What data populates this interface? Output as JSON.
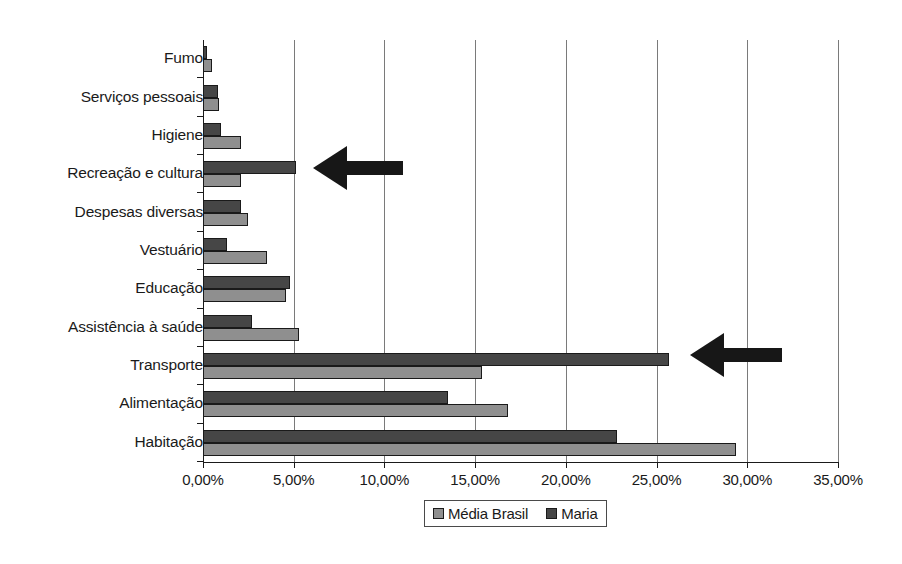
{
  "chart_data": {
    "type": "bar",
    "orientation": "horizontal",
    "title": "",
    "xlabel": "",
    "ylabel": "",
    "xlim": [
      0,
      35
    ],
    "xtick_labels": [
      "0,00%",
      "5,00%",
      "10,00%",
      "15,00%",
      "20,00%",
      "25,00%",
      "30,00%",
      "35,00%"
    ],
    "xticks": [
      0,
      5,
      10,
      15,
      20,
      25,
      30,
      35
    ],
    "grid": true,
    "grid_axis": "x",
    "legend_position": "bottom",
    "categories": [
      "Fumo",
      "Serviços pessoais",
      "Higiene",
      "Recreação e cultura",
      "Despesas diversas",
      "Vestuário",
      "Educação",
      "Assistência à saúde",
      "Transporte",
      "Alimentação",
      "Habitação"
    ],
    "series": [
      {
        "name": "Média Brasil",
        "color": "#8f8f8f",
        "values": [
          0.5,
          0.9,
          2.1,
          2.1,
          2.5,
          3.5,
          4.6,
          5.3,
          15.4,
          16.8,
          29.4
        ]
      },
      {
        "name": "Maria",
        "color": "#464646",
        "values": [
          0.2,
          0.8,
          1.0,
          5.1,
          2.1,
          1.3,
          4.8,
          2.7,
          25.7,
          13.5,
          22.8
        ]
      }
    ],
    "annotations": [
      {
        "type": "arrow",
        "direction": "left",
        "points_at_category": "Recreação e cultura",
        "points_at_series": "Maria"
      },
      {
        "type": "arrow",
        "direction": "left",
        "points_at_category": "Transporte",
        "points_at_series": "Maria"
      }
    ]
  },
  "legend": {
    "entries": [
      {
        "label": "Média Brasil",
        "color": "#8f8f8f"
      },
      {
        "label": "Maria",
        "color": "#464646"
      }
    ]
  }
}
